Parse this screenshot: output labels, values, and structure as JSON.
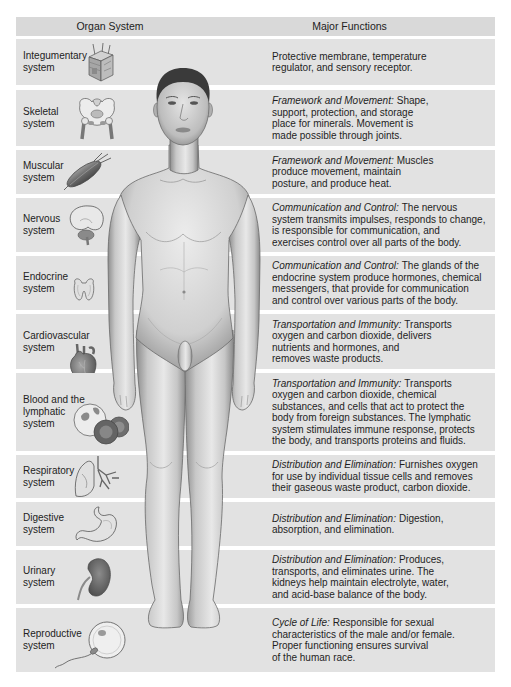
{
  "header": {
    "organ_system": "Organ System",
    "major_functions": "Major Functions"
  },
  "colors": {
    "band": "#e2e2e2",
    "header_band": "#d9d9d9",
    "text": "#1e1e1e"
  },
  "illustration": {
    "subject": "human-figure-anterior-view"
  },
  "rows": [
    {
      "label": [
        "Integumentary",
        "system"
      ],
      "icon": "skin-cube-icon",
      "category": "",
      "first_rest": "Protective membrane, temperature",
      "lines": [
        "regulator, and sensory receptor."
      ]
    },
    {
      "label": [
        "Skeletal",
        "system"
      ],
      "icon": "pelvis-bone-icon",
      "category": "Framework and Movement:",
      "first_rest": "Shape,",
      "lines": [
        "support, protection, and storage",
        "place for minerals. Movement is",
        "made possible through joints."
      ]
    },
    {
      "label": [
        "Muscular",
        "system"
      ],
      "icon": "muscle-icon",
      "category": "Framework and Movement:",
      "first_rest": "Muscles",
      "lines": [
        "produce movement, maintain",
        "posture, and produce heat."
      ]
    },
    {
      "label": [
        "Nervous",
        "system"
      ],
      "icon": "brain-icon",
      "category": "Communication and Control:",
      "first_rest": "The nervous",
      "lines": [
        "system transmits impulses, responds to change,",
        "is responsible for communication, and",
        "exercises control over all parts of the body."
      ]
    },
    {
      "label": [
        "Endocrine",
        "system"
      ],
      "icon": "thyroid-gland-icon",
      "category": "Communication and Control:",
      "first_rest": "The glands of the",
      "lines": [
        "endocrine system produce hormones, chemical",
        "messengers, that provide for communication",
        "and control over various parts of the body."
      ]
    },
    {
      "label": [
        "Cardiovascular",
        "system"
      ],
      "icon": "heart-icon",
      "category": "Transportation and Immunity:",
      "first_rest": "Transports",
      "lines": [
        "oxygen and carbon dioxide, delivers",
        "nutrients and hormones, and",
        "removes waste products."
      ]
    },
    {
      "label": [
        "Blood and the",
        "lymphatic",
        "system"
      ],
      "icon": "blood-cells-icon",
      "category": "Transportation and Immunity:",
      "first_rest": "Transports",
      "lines": [
        "oxygen and carbon dioxide, chemical",
        "substances, and cells that act to protect the",
        "body from foreign substances. The lymphatic",
        "system stimulates immune response, protects",
        "the body, and transports proteins and fluids."
      ]
    },
    {
      "label": [
        "Respiratory",
        "system"
      ],
      "icon": "lungs-icon",
      "category": "Distribution and Elimination:",
      "first_rest": "Furnishes oxygen",
      "lines": [
        "for use by individual tissue cells and removes",
        "their gaseous waste product, carbon dioxide."
      ]
    },
    {
      "label": [
        "Digestive",
        "system"
      ],
      "icon": "stomach-icon",
      "category": "Distribution and Elimination:",
      "first_rest": "Digestion,",
      "lines": [
        "absorption, and elimination."
      ]
    },
    {
      "label": [
        "Urinary",
        "system"
      ],
      "icon": "kidney-icon",
      "category": "Distribution and Elimination:",
      "first_rest": "Produces,",
      "lines": [
        "transports, and eliminates urine. The",
        "kidneys help maintain electrolyte, water,",
        "and acid-base balance of the body."
      ]
    },
    {
      "label": [
        "Reproductive",
        "system"
      ],
      "icon": "egg-and-sperm-icon",
      "category": "Cycle of Life:",
      "first_rest": "Responsible for sexual",
      "lines": [
        "characteristics of the male and/or female.",
        "Proper functioning ensures survival",
        "of the human race."
      ]
    }
  ]
}
